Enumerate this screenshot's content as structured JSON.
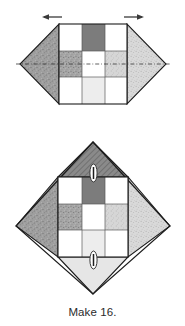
{
  "document": {
    "type": "quilting-pattern-instruction-diagram",
    "caption": "Make 16.",
    "figure_count": 2
  },
  "figures": [
    {
      "id": "unit-flat-with-side-flaps",
      "label": "pieced nine-patch unit with side triangles pressed open",
      "grid": {
        "rows": 3,
        "cols": 3,
        "cells": [
          [
            {
              "name": "cell-r1c1",
              "fabric": "white",
              "color": "#ffffff"
            },
            {
              "name": "cell-r1c2",
              "fabric": "dark-gray-solid",
              "color": "#7c7c7c"
            },
            {
              "name": "cell-r1c3",
              "fabric": "white",
              "color": "#ffffff"
            }
          ],
          [
            {
              "name": "cell-r2c1",
              "fabric": "medium-gray-speckled",
              "color": "#a3a3a3"
            },
            {
              "name": "cell-r2c2",
              "fabric": "white",
              "color": "#ffffff"
            },
            {
              "name": "cell-r2c3",
              "fabric": "light-gray-speckled",
              "color": "#d3d3d3"
            }
          ],
          [
            {
              "name": "cell-r3c1",
              "fabric": "white",
              "color": "#ffffff"
            },
            {
              "name": "cell-r3c2",
              "fabric": "very-light-gray",
              "color": "#ededed"
            },
            {
              "name": "cell-r3c3",
              "fabric": "white",
              "color": "#ffffff"
            }
          ]
        ]
      },
      "flaps": [
        {
          "name": "left-triangle-flap",
          "fabric": "medium-gray-speckled",
          "color": "#9e9e9e",
          "direction": "points-left"
        },
        {
          "name": "right-triangle-flap",
          "fabric": "light-gray-speckled",
          "color": "#d6d6d6",
          "direction": "points-right"
        }
      ],
      "annotations": [
        {
          "name": "press-arrow-left",
          "glyph": "arrow",
          "direction": "left"
        },
        {
          "name": "press-arrow-right",
          "glyph": "arrow",
          "direction": "right"
        },
        {
          "name": "center-fold-line",
          "glyph": "dash-dot-line",
          "orientation": "horizontal"
        }
      ]
    },
    {
      "id": "unit-on-point-complete",
      "label": "completed unit set on point with four corner triangles",
      "grid": {
        "rows": 3,
        "cols": 3,
        "cells": [
          [
            {
              "name": "cell-r1c1",
              "fabric": "white",
              "color": "#ffffff"
            },
            {
              "name": "cell-r1c2",
              "fabric": "dark-gray-solid",
              "color": "#7c7c7c"
            },
            {
              "name": "cell-r1c3",
              "fabric": "white",
              "color": "#ffffff"
            }
          ],
          [
            {
              "name": "cell-r2c1",
              "fabric": "medium-gray-speckled",
              "color": "#a3a3a3"
            },
            {
              "name": "cell-r2c2",
              "fabric": "white",
              "color": "#ffffff"
            },
            {
              "name": "cell-r2c3",
              "fabric": "light-gray-speckled",
              "color": "#d3d3d3"
            }
          ],
          [
            {
              "name": "cell-r3c1",
              "fabric": "white",
              "color": "#ffffff"
            },
            {
              "name": "cell-r3c2",
              "fabric": "very-light-gray",
              "color": "#ededed"
            },
            {
              "name": "cell-r3c3",
              "fabric": "white",
              "color": "#ffffff"
            }
          ]
        ]
      },
      "corners": [
        {
          "name": "top-corner-triangle",
          "fabric": "dark-gray-hatched",
          "color": "#808080"
        },
        {
          "name": "left-corner-triangle",
          "fabric": "medium-gray-speckled",
          "color": "#9e9e9e"
        },
        {
          "name": "right-corner-triangle",
          "fabric": "light-gray-speckled",
          "color": "#d6d6d6"
        },
        {
          "name": "bottom-corner-triangle",
          "fabric": "very-light-gray",
          "color": "#e4e4e4"
        }
      ],
      "annotations": [
        {
          "name": "pin-marker-top",
          "glyph": "pin",
          "position": "top-center-seam"
        },
        {
          "name": "pin-marker-bottom",
          "glyph": "pin",
          "position": "bottom-center-seam"
        }
      ]
    }
  ],
  "palette": {
    "outline": "#1c1c1c",
    "white": "#ffffff",
    "dark_solid": "#7c7c7c",
    "dark_hatch": "#808080",
    "medium_speckle": "#9e9e9e",
    "light_speckle": "#d6d6d6",
    "very_light": "#e9e9e9",
    "caption_text": "#2b2b2b"
  }
}
